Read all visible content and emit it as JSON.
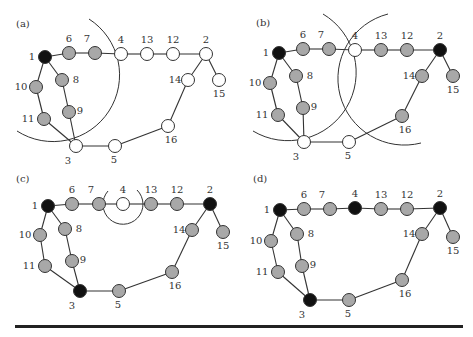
{
  "colors": {
    "black": "#111111",
    "gray": "#a8a8a8",
    "white": "#ffffff"
  },
  "edges": [
    [
      1,
      6
    ],
    [
      6,
      7
    ],
    [
      7,
      4
    ],
    [
      4,
      13
    ],
    [
      13,
      12
    ],
    [
      12,
      2
    ],
    [
      2,
      14
    ],
    [
      2,
      15
    ],
    [
      14,
      16
    ],
    [
      16,
      5
    ],
    [
      5,
      3
    ],
    [
      3,
      9
    ],
    [
      9,
      8
    ],
    [
      8,
      1
    ],
    [
      1,
      10
    ],
    [
      10,
      11
    ],
    [
      11,
      3
    ]
  ],
  "panels": [
    {
      "label": "(a)",
      "states": {
        "1": "black",
        "6": "gray",
        "7": "gray",
        "8": "gray",
        "9": "gray",
        "10": "gray",
        "11": "gray",
        "4": "white",
        "13": "white",
        "12": "white",
        "2": "white",
        "14": "white",
        "15": "white",
        "16": "white",
        "3": "white",
        "5": "white"
      }
    },
    {
      "label": "(b)",
      "states": {
        "1": "black",
        "2": "black",
        "6": "gray",
        "7": "gray",
        "8": "gray",
        "9": "gray",
        "10": "gray",
        "11": "gray",
        "13": "gray",
        "12": "gray",
        "14": "gray",
        "15": "gray",
        "16": "gray",
        "4": "white",
        "3": "white",
        "5": "white"
      }
    },
    {
      "label": "(c)",
      "states": {
        "1": "black",
        "2": "black",
        "3": "black",
        "6": "gray",
        "7": "gray",
        "8": "gray",
        "9": "gray",
        "10": "gray",
        "11": "gray",
        "13": "gray",
        "12": "gray",
        "14": "gray",
        "15": "gray",
        "16": "gray",
        "5": "gray",
        "4": "white"
      }
    },
    {
      "label": "(d)",
      "states": {
        "1": "black",
        "2": "black",
        "3": "black",
        "4": "black",
        "6": "gray",
        "7": "gray",
        "8": "gray",
        "9": "gray",
        "10": "gray",
        "11": "gray",
        "13": "gray",
        "12": "gray",
        "14": "gray",
        "15": "gray",
        "16": "gray",
        "5": "gray"
      }
    }
  ]
}
